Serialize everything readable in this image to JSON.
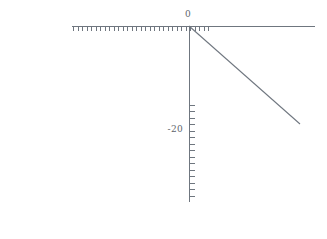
{
  "figure": {
    "background_color": "#ffffff",
    "axis_color": "#6f767f",
    "line_color": "#6f767f",
    "label_color": "#5d646c",
    "width": 327,
    "height": 239
  },
  "labels": {
    "x_axis_origin_label": "0",
    "y_axis_label_minus20": "-20"
  },
  "chart_data": {
    "type": "line",
    "title": "",
    "xlabel": "",
    "ylabel": "",
    "grid": false,
    "legend": null,
    "axis_position": "origin-crossing",
    "xlim": [
      -26,
      14
    ],
    "ylim": [
      -40,
      0
    ],
    "xticks": [
      0
    ],
    "xtick_labels": [
      "0"
    ],
    "yticks": [
      -20
    ],
    "ytick_labels": [
      "-20"
    ],
    "x_minor_tick_count": 31,
    "y_minor_tick_count": 15,
    "series": [
      {
        "name": "line",
        "x": [
          0,
          14
        ],
        "y": [
          0,
          -20
        ]
      }
    ],
    "annotations": []
  },
  "geometry": {
    "x_axis": {
      "x1": 72,
      "y1": 26,
      "x2": 315,
      "y2": 26
    },
    "y_axis": {
      "x1": 189,
      "y1": 26,
      "x2": 189,
      "y2": 202
    },
    "diagonal": {
      "x1": 189,
      "y1": 26,
      "x2": 300,
      "y2": 124
    },
    "x_tick_start": 73,
    "x_tick_end": 212,
    "x_tick_spacing": 4.5,
    "x_tick_length": 4,
    "y_tick_start": 105,
    "y_tick_end": 202,
    "y_tick_spacing": 6.47,
    "y_tick_length": 5,
    "origin": {
      "x": 189,
      "y": 26
    },
    "label_zero": {
      "x": 188,
      "y": 17
    },
    "label_minus20": {
      "x": 183,
      "y": 132
    }
  }
}
